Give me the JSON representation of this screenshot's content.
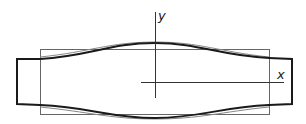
{
  "diagram": {
    "axes": {
      "x_label": "x",
      "y_label": "y"
    },
    "colors": {
      "thick_outline": "#1a1a1a",
      "thin_outline": "#555555",
      "axis": "#333333",
      "background": "#ffffff"
    }
  }
}
